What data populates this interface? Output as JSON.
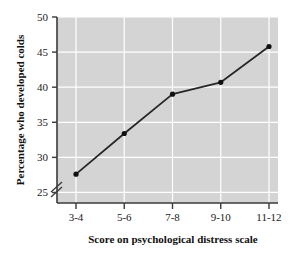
{
  "chart_data": {
    "type": "line",
    "title": "",
    "xlabel": "Score on psychological distress scale",
    "ylabel": "Percentage who developed colds",
    "categories": [
      "3-4",
      "5-6",
      "7-8",
      "9-10",
      "11-12"
    ],
    "values": [
      27.6,
      33.4,
      39.0,
      40.7,
      45.8
    ],
    "series": [
      {
        "name": "Percentage who developed colds",
        "values": [
          27.6,
          33.4,
          39.0,
          40.7,
          45.8
        ]
      }
    ],
    "ylim": [
      23.5,
      50
    ],
    "yticks": [
      25,
      30,
      35,
      40,
      45,
      50
    ],
    "ytick_labels": [
      "25",
      "30",
      "35",
      "40",
      "45",
      "50"
    ],
    "xtick_labels": [
      "3-4",
      "5-6",
      "7-8",
      "9-10",
      "11-12"
    ],
    "axis_break": true,
    "axis_break_note": "y-axis broken below 25",
    "grid": true,
    "grid_color": "#ffffff",
    "plot_background": "#d4d4d4",
    "figure_background": "#ffffff",
    "line_color": "#262626",
    "marker_color": "#111111",
    "marker": "circle",
    "legend": false,
    "legend_position": "none"
  }
}
